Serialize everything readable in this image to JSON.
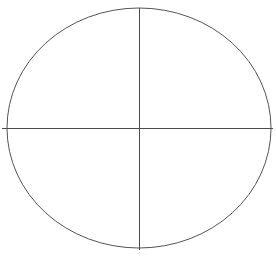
{
  "figure": {
    "title": "Quartered circle diagram",
    "canvas": {
      "width": 276,
      "height": 256,
      "background_color": "#ffffff"
    },
    "style": {
      "stroke_color": "#545454",
      "axis_stroke_color": "#4c4c4c",
      "stroke_width": 1,
      "fill": "none"
    },
    "ellipse": {
      "name": "outer-circle",
      "center_x": 139,
      "center_y": 128,
      "radius_x": 132,
      "radius_y": 120,
      "left_edge_x": 7,
      "right_edge_x": 271,
      "top_edge_y": 8,
      "bottom_edge_y": 248
    },
    "vertical_diameter": {
      "name": "vertical-axis",
      "x": 139,
      "y_start": 8,
      "y_end": 250
    },
    "horizontal_diameter": {
      "name": "horizontal-axis",
      "y": 128,
      "x_start": 2,
      "x_end": 273
    },
    "quadrants": [
      {
        "id": "upper-left",
        "label": ""
      },
      {
        "id": "upper-right",
        "label": ""
      },
      {
        "id": "lower-left",
        "label": ""
      },
      {
        "id": "lower-right",
        "label": ""
      }
    ]
  },
  "chart_data": {
    "type": "diagram",
    "title": "",
    "subtitle": "",
    "xlabel": "",
    "ylabel": "",
    "grid": false,
    "legend": null,
    "annotations": [],
    "shapes": [
      {
        "kind": "ellipse",
        "cx": 139,
        "cy": 128,
        "rx": 132,
        "ry": 120,
        "stroke": "#545454",
        "fill": "none"
      },
      {
        "kind": "line",
        "x1": 139,
        "y1": 8,
        "x2": 139,
        "y2": 250,
        "stroke": "#4c4c4c"
      },
      {
        "kind": "line",
        "x1": 2,
        "y1": 128,
        "x2": 273,
        "y2": 128,
        "stroke": "#4c4c4c"
      }
    ]
  }
}
